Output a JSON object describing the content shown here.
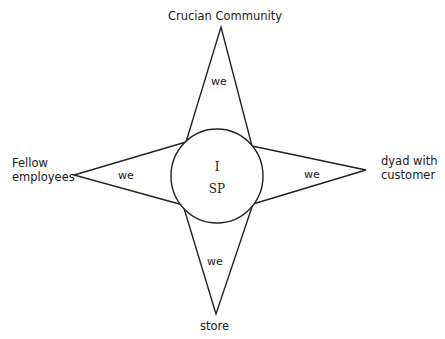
{
  "diagram": {
    "type": "four-pointed-star",
    "center": {
      "shape": "circle",
      "line1": "I",
      "line2": "SP"
    },
    "arms": [
      {
        "direction": "top",
        "label": "Crucian Community",
        "inner_label": "we"
      },
      {
        "direction": "left",
        "label_line1": "Fellow",
        "label_line2": "employees",
        "inner_label": "we"
      },
      {
        "direction": "right",
        "label_line1": "dyad with",
        "label_line2": "customer",
        "inner_label": "we"
      },
      {
        "direction": "bottom",
        "label": "store",
        "inner_label": "we"
      }
    ],
    "stroke_color": "#222222",
    "fill_color": "#ffffff"
  }
}
